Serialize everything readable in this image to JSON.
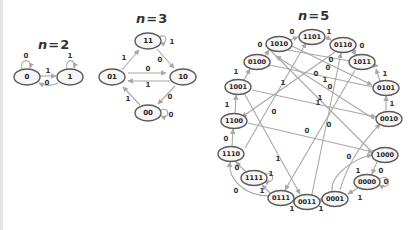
{
  "graphs": [
    {
      "id": "n2",
      "title_var": "n",
      "title_eq": "=",
      "title_val": "2",
      "nodes": [
        {
          "id": "0",
          "label": "0"
        },
        {
          "id": "1",
          "label": "1"
        }
      ],
      "edges": [
        {
          "from": "0",
          "to": "0",
          "label": "0"
        },
        {
          "from": "0",
          "to": "1",
          "label": "1"
        },
        {
          "from": "1",
          "to": "0",
          "label": "0"
        },
        {
          "from": "1",
          "to": "1",
          "label": "1"
        }
      ]
    },
    {
      "id": "n3",
      "title_var": "n",
      "title_eq": "=",
      "title_val": "3",
      "nodes": [
        {
          "id": "11",
          "label": "11"
        },
        {
          "id": "01",
          "label": "01"
        },
        {
          "id": "10",
          "label": "10"
        },
        {
          "id": "00",
          "label": "00"
        }
      ],
      "edges": [
        {
          "from": "11",
          "to": "11",
          "label": "1"
        },
        {
          "from": "01",
          "to": "11",
          "label": "1"
        },
        {
          "from": "11",
          "to": "10",
          "label": "0"
        },
        {
          "from": "01",
          "to": "10",
          "label": "0"
        },
        {
          "from": "10",
          "to": "01",
          "label": "1"
        },
        {
          "from": "10",
          "to": "00",
          "label": "0"
        },
        {
          "from": "00",
          "to": "01",
          "label": "1"
        },
        {
          "from": "00",
          "to": "00",
          "label": "0"
        }
      ]
    },
    {
      "id": "n5",
      "title_var": "n",
      "title_eq": "=",
      "title_val": "5",
      "nodes": [
        {
          "id": "1101",
          "label": "1101"
        },
        {
          "id": "1010",
          "label": "1010"
        },
        {
          "id": "0110",
          "label": "0110"
        },
        {
          "id": "0100",
          "label": "0100"
        },
        {
          "id": "1011",
          "label": "1011"
        },
        {
          "id": "1001",
          "label": "1001"
        },
        {
          "id": "0101",
          "label": "0101"
        },
        {
          "id": "1100",
          "label": "1100"
        },
        {
          "id": "0010",
          "label": "0010"
        },
        {
          "id": "1110",
          "label": "1110"
        },
        {
          "id": "1000",
          "label": "1000"
        },
        {
          "id": "1111",
          "label": "1111"
        },
        {
          "id": "0000",
          "label": "0000"
        },
        {
          "id": "0111",
          "label": "0111"
        },
        {
          "id": "0011",
          "label": "0011"
        },
        {
          "id": "0001",
          "label": "0001"
        }
      ],
      "edge_labels": [
        "0",
        "1",
        "0",
        "0",
        "1",
        "1",
        "1",
        "1",
        "0",
        "0",
        "1",
        "0",
        "0",
        "1",
        "0",
        "0",
        "1",
        "0",
        "0",
        "0",
        "1",
        "1",
        "1",
        "0",
        "0",
        "1",
        "0",
        "1",
        "1",
        "1",
        "1",
        "0"
      ]
    }
  ]
}
